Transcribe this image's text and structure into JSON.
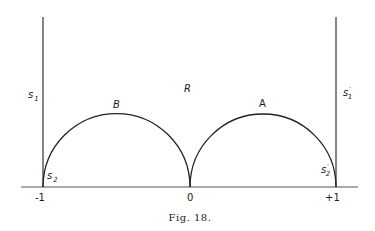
{
  "figure": {
    "caption": "Fig. 18.",
    "region_label": "R",
    "arcs": [
      {
        "label": "B",
        "from": -1,
        "to": 0
      },
      {
        "label": "A",
        "from": 0,
        "to": 1
      }
    ],
    "axis_ticks": [
      "-1",
      "0",
      "+1"
    ],
    "side_labels": {
      "left_upper": {
        "main": "s",
        "sub": "1",
        "prime": ""
      },
      "left_lower": {
        "main": "s",
        "sub": "2",
        "prime": ""
      },
      "right_upper": {
        "main": "s",
        "sub": "1",
        "prime": "′"
      },
      "right_lower": {
        "main": "s",
        "sub": "2",
        "prime": "′"
      }
    },
    "colors": {
      "ink": "#222222",
      "background": "#ffffff"
    }
  }
}
